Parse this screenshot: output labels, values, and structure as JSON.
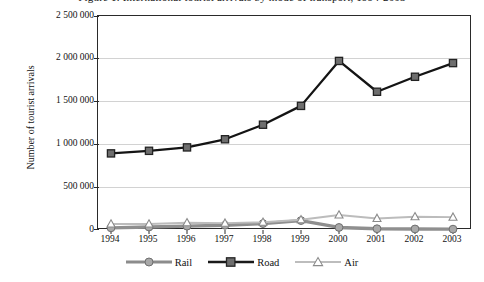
{
  "chart_data": {
    "type": "line",
    "title": "Figure 1. International tourist arrivals by mode of transport, 1994-2003",
    "xlabel": "",
    "ylabel": "Number of tourist arrivals",
    "categories": [
      "1994",
      "1995",
      "1996",
      "1997",
      "1998",
      "1999",
      "2000",
      "2001",
      "2002",
      "2003"
    ],
    "ylim": [
      0,
      2500000
    ],
    "ytick_labels": [
      "0",
      "500 000",
      "1 000 000",
      "1 500 000",
      "2 000 000",
      "2 500 000"
    ],
    "ytick_values": [
      0,
      500000,
      1000000,
      1500000,
      2000000,
      2500000
    ],
    "grid": true,
    "legend_position": "bottom",
    "series": [
      {
        "name": "Rail",
        "marker": "circle",
        "color": "#8c8c8c",
        "values": [
          25000,
          35000,
          45000,
          55000,
          75000,
          110000,
          30000,
          15000,
          12000,
          10000
        ]
      },
      {
        "name": "Road",
        "marker": "square",
        "color": "#1a1a1a",
        "values": [
          895000,
          925000,
          965000,
          1060000,
          1230000,
          1450000,
          1975000,
          1615000,
          1790000,
          1950000
        ]
      },
      {
        "name": "Air",
        "marker": "triangle",
        "color": "#b5b5b5",
        "values": [
          70000,
          70000,
          85000,
          80000,
          90000,
          120000,
          175000,
          135000,
          155000,
          150000
        ]
      }
    ]
  }
}
